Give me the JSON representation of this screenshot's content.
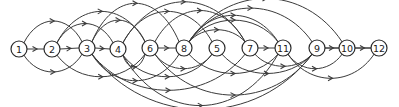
{
  "diagram": {
    "type": "directed-acyclic-graph",
    "colors": {
      "stroke": "#3a3a3a",
      "node_fill": "#ffffff",
      "text": "#222222"
    },
    "nodes": [
      {
        "id": "1",
        "label": "1",
        "x": 19,
        "y": 49
      },
      {
        "id": "2",
        "label": "2",
        "x": 52,
        "y": 49
      },
      {
        "id": "3",
        "label": "3",
        "x": 87,
        "y": 48
      },
      {
        "id": "4",
        "label": "4",
        "x": 118,
        "y": 49
      },
      {
        "id": "6",
        "label": "6",
        "x": 150,
        "y": 48
      },
      {
        "id": "8",
        "label": "8",
        "x": 184,
        "y": 48
      },
      {
        "id": "5",
        "label": "5",
        "x": 217,
        "y": 48
      },
      {
        "id": "7",
        "label": "7",
        "x": 250,
        "y": 48
      },
      {
        "id": "11",
        "label": "11",
        "x": 283,
        "y": 48
      },
      {
        "id": "9",
        "label": "9",
        "x": 317,
        "y": 48
      },
      {
        "id": "10",
        "label": "10",
        "x": 347,
        "y": 48
      },
      {
        "id": "12",
        "label": "12",
        "x": 379,
        "y": 48
      }
    ],
    "edges": [
      {
        "from": "1",
        "to": "2",
        "side": "straight"
      },
      {
        "from": "2",
        "to": "3",
        "side": "straight"
      },
      {
        "from": "3",
        "to": "4",
        "side": "straight"
      },
      {
        "from": "6",
        "to": "8",
        "side": "straight"
      },
      {
        "from": "7",
        "to": "11",
        "side": "straight"
      },
      {
        "from": "9",
        "to": "10",
        "side": "straight"
      },
      {
        "from": "10",
        "to": "12",
        "side": "straight"
      },
      {
        "from": "1",
        "to": "3",
        "side": "above",
        "h": 22
      },
      {
        "from": "1",
        "to": "3",
        "side": "below",
        "h": 18
      },
      {
        "from": "2",
        "to": "4",
        "side": "above",
        "h": 20
      },
      {
        "from": "2",
        "to": "6",
        "side": "above",
        "h": 30
      },
      {
        "from": "2",
        "to": "6",
        "side": "below",
        "h": 22
      },
      {
        "from": "3",
        "to": "6",
        "side": "above",
        "h": 22
      },
      {
        "from": "3",
        "to": "8",
        "side": "above",
        "h": 36
      },
      {
        "from": "3",
        "to": "8",
        "side": "below",
        "h": 26
      },
      {
        "from": "3",
        "to": "7",
        "side": "below",
        "h": 34
      },
      {
        "from": "3",
        "to": "9",
        "side": "below",
        "h": 50
      },
      {
        "from": "4",
        "to": "6",
        "side": "below",
        "h": 14
      },
      {
        "from": "4",
        "to": "5",
        "side": "above",
        "h": 30
      },
      {
        "from": "4",
        "to": "7",
        "side": "above",
        "h": 38
      },
      {
        "from": "4",
        "to": "5",
        "side": "below",
        "h": 22
      },
      {
        "from": "4",
        "to": "11",
        "side": "below",
        "h": 46
      },
      {
        "from": "6",
        "to": "7",
        "side": "above",
        "h": 30
      },
      {
        "from": "6",
        "to": "5",
        "side": "below",
        "h": 16
      },
      {
        "from": "6",
        "to": "9",
        "side": "below",
        "h": 38
      },
      {
        "from": "8",
        "to": "10",
        "side": "above",
        "h": 40
      },
      {
        "from": "8",
        "to": "9",
        "side": "above",
        "h": 32
      },
      {
        "from": "8",
        "to": "11",
        "side": "above",
        "h": 26
      },
      {
        "from": "8",
        "to": "11",
        "side": "above",
        "h": 22
      },
      {
        "from": "8",
        "to": "7",
        "side": "above",
        "h": 14
      },
      {
        "from": "8",
        "to": "11",
        "side": "below",
        "h": 20
      },
      {
        "from": "5",
        "to": "9",
        "side": "below",
        "h": 20
      },
      {
        "from": "7",
        "to": "9",
        "side": "below",
        "h": 14
      },
      {
        "from": "11",
        "to": "10",
        "side": "below",
        "h": 16
      },
      {
        "from": "11",
        "to": "12",
        "side": "below",
        "h": 24
      },
      {
        "from": "9",
        "to": "12",
        "side": "above",
        "h": 0
      }
    ]
  }
}
